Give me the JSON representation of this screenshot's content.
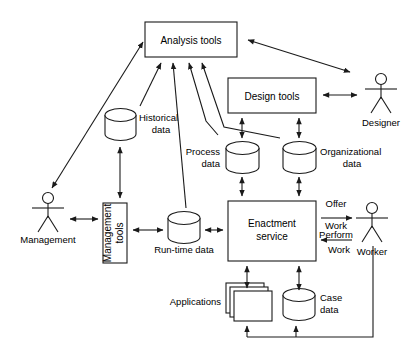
{
  "diagram": {
    "stroke_color": "#1a1a1a",
    "fill_color": "#ffffff",
    "boxes": [
      {
        "id": "analysis_tools",
        "label": "Analysis tools",
        "x": 145,
        "y": 22,
        "w": 92,
        "h": 35,
        "orientation": "horizontal"
      },
      {
        "id": "design_tools",
        "label": "Design tools",
        "x": 228,
        "y": 78,
        "w": 88,
        "h": 35,
        "orientation": "horizontal"
      },
      {
        "id": "management_tools",
        "label": "Management tools",
        "x": 103,
        "y": 203,
        "w": 24,
        "h": 60,
        "orientation": "vertical"
      },
      {
        "id": "enactment_service",
        "label": "Enactment service",
        "x": 228,
        "y": 201,
        "w": 88,
        "h": 60,
        "orientation": "horizontal"
      }
    ],
    "datastores": [
      {
        "id": "historical_data",
        "label": "Historical data",
        "x": 105,
        "y": 108,
        "w": 31,
        "h": 33,
        "label_pos": "right"
      },
      {
        "id": "process_data",
        "label": "Process data",
        "x": 226,
        "y": 141,
        "w": 33,
        "h": 33,
        "label_pos": "left"
      },
      {
        "id": "organizational_data",
        "label": "Organizational data",
        "x": 283,
        "y": 141,
        "w": 33,
        "h": 33,
        "label_pos": "right"
      },
      {
        "id": "runtime_data",
        "label": "Run-time data",
        "x": 168,
        "y": 211,
        "w": 32,
        "h": 33,
        "label_pos": "below"
      },
      {
        "id": "case_data",
        "label": "Case data",
        "x": 283,
        "y": 288,
        "w": 32,
        "h": 33,
        "label_pos": "right"
      }
    ],
    "applications": {
      "id": "applications",
      "label": "Applications",
      "x": 226,
      "y": 283,
      "w": 46,
      "h": 38,
      "label_pos": "left"
    },
    "actors": [
      {
        "id": "management",
        "label": "Management",
        "x": 48,
        "y": 193
      },
      {
        "id": "designer",
        "label": "Designer",
        "x": 381,
        "y": 74
      },
      {
        "id": "worker",
        "label": "Worker",
        "x": 372,
        "y": 203
      }
    ],
    "edge_labels": [
      {
        "id": "offer_work",
        "line1": "Offer",
        "line2": "Work",
        "direction": "right"
      },
      {
        "id": "perform_work",
        "line1": "Perform",
        "line2": "Work",
        "direction": "left"
      }
    ],
    "connections": [
      {
        "from": "management",
        "to": "analysis_tools",
        "arrow": "double"
      },
      {
        "from": "analysis_tools",
        "to": "designer",
        "arrow": "double"
      },
      {
        "from": "design_tools",
        "to": "designer",
        "arrow": "double"
      },
      {
        "from": "historical_data",
        "to": "analysis_tools",
        "arrow": "single"
      },
      {
        "from": "runtime_data",
        "to": "analysis_tools",
        "arrow": "single"
      },
      {
        "from": "process_data",
        "to": "analysis_tools",
        "arrow": "single"
      },
      {
        "from": "organizational_data",
        "to": "analysis_tools",
        "arrow": "single"
      },
      {
        "from": "historical_data",
        "to": "management_tools",
        "arrow": "double"
      },
      {
        "from": "management",
        "to": "management_tools",
        "arrow": "double"
      },
      {
        "from": "management_tools",
        "to": "runtime_data",
        "arrow": "double"
      },
      {
        "from": "runtime_data",
        "to": "enactment_service",
        "arrow": "double"
      },
      {
        "from": "design_tools",
        "to": "process_data",
        "arrow": "double"
      },
      {
        "from": "design_tools",
        "to": "organizational_data",
        "arrow": "double"
      },
      {
        "from": "process_data",
        "to": "enactment_service",
        "arrow": "double"
      },
      {
        "from": "organizational_data",
        "to": "enactment_service",
        "arrow": "double"
      },
      {
        "from": "enactment_service",
        "to": "applications",
        "arrow": "double"
      },
      {
        "from": "enactment_service",
        "to": "case_data",
        "arrow": "double"
      },
      {
        "from": "enactment_service",
        "to": "worker",
        "arrow": "right",
        "label": "offer_work"
      },
      {
        "from": "worker",
        "to": "enactment_service",
        "arrow": "left",
        "label": "perform_work"
      },
      {
        "from": "worker",
        "to": "applications",
        "arrow": "single"
      },
      {
        "from": "worker",
        "to": "case_data",
        "arrow": "single"
      }
    ]
  }
}
